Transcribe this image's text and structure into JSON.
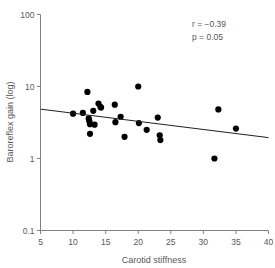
{
  "chart_data": {
    "type": "scatter",
    "title": "",
    "xlabel": "Carotid stiffness",
    "ylabel": "Baroreflex gain (log)",
    "xlim": [
      5,
      40
    ],
    "ylim": [
      0.1,
      100
    ],
    "yscale": "log",
    "xscale": "linear",
    "grid": false,
    "legend": null,
    "xticks": [
      5,
      10,
      15,
      20,
      25,
      30,
      35,
      40
    ],
    "xtick_labels": [
      "5",
      "10",
      "15",
      "20",
      "25",
      "30",
      "35",
      "40"
    ],
    "yticks": [
      0.1,
      1,
      10,
      100
    ],
    "ytick_labels": [
      "0.1",
      "1",
      "10",
      "100"
    ],
    "points": [
      {
        "x": 10.0,
        "y": 4.2
      },
      {
        "x": 11.5,
        "y": 4.3
      },
      {
        "x": 12.2,
        "y": 8.4
      },
      {
        "x": 12.4,
        "y": 3.6
      },
      {
        "x": 12.5,
        "y": 3.3
      },
      {
        "x": 12.6,
        "y": 3.0
      },
      {
        "x": 12.6,
        "y": 2.2
      },
      {
        "x": 13.1,
        "y": 4.6
      },
      {
        "x": 13.3,
        "y": 2.95
      },
      {
        "x": 13.9,
        "y": 5.8
      },
      {
        "x": 14.2,
        "y": 5.2
      },
      {
        "x": 14.3,
        "y": 5.1
      },
      {
        "x": 16.4,
        "y": 5.6
      },
      {
        "x": 16.5,
        "y": 3.2
      },
      {
        "x": 17.3,
        "y": 3.8
      },
      {
        "x": 17.9,
        "y": 2.0
      },
      {
        "x": 20.0,
        "y": 10.0
      },
      {
        "x": 20.1,
        "y": 3.1
      },
      {
        "x": 21.3,
        "y": 2.5
      },
      {
        "x": 23.0,
        "y": 3.7
      },
      {
        "x": 23.3,
        "y": 2.1
      },
      {
        "x": 23.4,
        "y": 1.8
      },
      {
        "x": 31.7,
        "y": 1.0
      },
      {
        "x": 32.3,
        "y": 4.8
      },
      {
        "x": 35.0,
        "y": 2.6
      }
    ],
    "trend_line": {
      "x_start": 5.0,
      "y_start": 4.85,
      "x_end": 40.0,
      "y_end": 1.95
    },
    "annotations": [
      {
        "name": "correlation",
        "text": "r = −0.39"
      },
      {
        "name": "p-value",
        "text": "p = 0.05"
      }
    ]
  },
  "colors": {
    "point": "#000000",
    "axis": "#808083",
    "text": "#58585a",
    "trend": "#231f20",
    "background": "#ffffff"
  }
}
